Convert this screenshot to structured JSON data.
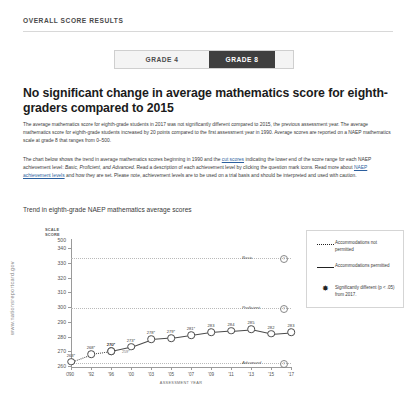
{
  "site_url": "www.nationsreportcard.gov",
  "section_header": "OVERALL SCORE RESULTS",
  "grade_toggle": {
    "grade4_label": "GRADE 4",
    "grade8_label": "GRADE 8",
    "active": "GRADE 8"
  },
  "headline": "No significant change in average mathematics score for eighth-graders compared to 2015",
  "paragraph1": "The average mathematics score for eighth-grade students in 2017 was not significantly different compared to 2015, the previous assessment year. The average mathematics score for eighth-grade students increased by 20 points compared to the first assessment year in 1990. Average scores are reported on a NAEP mathematics scale at grade 8 that ranges from 0–500.",
  "paragraph2_a": "The chart below shows the trend in average mathematics scores beginning in 1990 and the ",
  "paragraph2_link1": "cut scores",
  "paragraph2_b": " indicating the lower end of the score range for each NAEP achievement level: ",
  "paragraph2_c": "Basic, Proficient, and Advanced",
  "paragraph2_d": ". Read a description of each achievement level by clicking the question mark icons. Read more about ",
  "paragraph2_link2": "NAEP achievement levels",
  "paragraph2_e": " and how they are set. Please note, achievement levels are to be used on a trial basis and should be interpreted and used with caution.",
  "chart_title": "Trend in eighth-grade NAEP mathematics average scores",
  "legend": {
    "item1": "Accommodations not permitted",
    "item2": "Accommodations permitted",
    "item3": "Significantly different (p < .05) from 2017.",
    "star_glyph": "✸"
  },
  "achievement_levels": [
    {
      "name": "Advanced",
      "score": 333,
      "help": "?"
    },
    {
      "name": "Proficient",
      "score": 299,
      "help": "?"
    },
    {
      "name": "Basic",
      "score": 262,
      "help": "?"
    }
  ],
  "chart_data": {
    "type": "line",
    "title": "Trend in eighth-grade NAEP mathematics average scores",
    "xlabel": "ASSESSMENT YEAR",
    "ylabel": "SCALE SCORE",
    "ylim": [
      260,
      340
    ],
    "y_axis_top_label": "500",
    "y_axis_zero_label": "0",
    "yticks": [
      340,
      330,
      320,
      310,
      300,
      290,
      280,
      270,
      260
    ],
    "grid": false,
    "legend_position": "right",
    "x": [
      "'90",
      "'92",
      "'96",
      "'00",
      "'03",
      "'05",
      "'07",
      "'09",
      "'11",
      "'13",
      "'15",
      "'17"
    ],
    "series": [
      {
        "name": "Accommodations not permitted",
        "style": "dotted",
        "points": [
          {
            "year": "'90",
            "value": 263,
            "label": "263*"
          },
          {
            "year": "'92",
            "value": 268,
            "label": "268*"
          },
          {
            "year": "'96",
            "value": 270,
            "label": "270*"
          }
        ]
      },
      {
        "name": "Accommodations permitted",
        "style": "solid",
        "points": [
          {
            "year": "'96",
            "value": 270,
            "label": "270*"
          },
          {
            "year": "'00",
            "value": 273,
            "label": "273*"
          },
          {
            "year": "'03",
            "value": 278,
            "label": "278*"
          },
          {
            "year": "'05",
            "value": 279,
            "label": "279*"
          },
          {
            "year": "'07",
            "value": 281,
            "label": "281*"
          },
          {
            "year": "'09",
            "value": 283,
            "label": "283"
          },
          {
            "year": "'11",
            "value": 284,
            "label": "284"
          },
          {
            "year": "'13",
            "value": 285,
            "label": "285"
          },
          {
            "year": "'15",
            "value": 282,
            "label": "282"
          },
          {
            "year": "'17",
            "value": 283,
            "label": "283"
          }
        ]
      }
    ],
    "cut_scores": [
      {
        "level": "Basic",
        "value": 262
      },
      {
        "level": "Proficient",
        "value": 299
      },
      {
        "level": "Advanced",
        "value": 333
      }
    ],
    "annotations": [
      {
        "text": "259*",
        "note": "lower cut marker label"
      }
    ]
  }
}
